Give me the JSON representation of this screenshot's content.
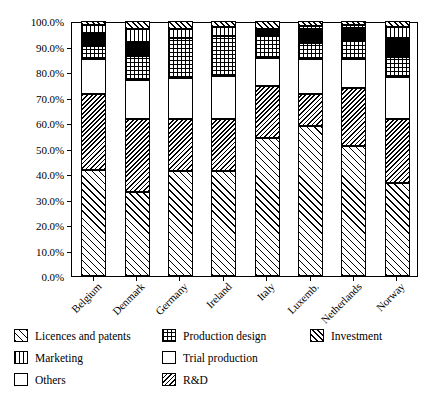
{
  "chart_data": {
    "type": "bar",
    "subtype": "stacked-100-percent",
    "title": "",
    "xlabel": "",
    "ylabel": "",
    "ylim": [
      0,
      100
    ],
    "ytick_labels": [
      "0.0%",
      "10.0%",
      "20.0%",
      "30.0%",
      "40.0%",
      "50.0%",
      "60.0%",
      "70.0%",
      "80.0%",
      "90.0%",
      "100.0%"
    ],
    "ytick_values": [
      0,
      10,
      20,
      30,
      40,
      50,
      60,
      70,
      80,
      90,
      100
    ],
    "grid": false,
    "legend_position": "bottom",
    "categories": [
      "Belgium",
      "Denmark",
      "Germany",
      "Ireland",
      "Italy",
      "Luxemb.",
      "Netherlands",
      "Norway"
    ],
    "series": [
      {
        "name": "Licences and patents",
        "pattern": "sparse-diagonal-forward",
        "values": [
          41.5,
          33.0,
          41.0,
          41.0,
          54.0,
          58.8,
          51.0,
          36.5
        ]
      },
      {
        "name": "R&D",
        "pattern": "dense-diagonal-back",
        "values": [
          30.0,
          28.5,
          20.5,
          20.5,
          20.5,
          12.5,
          22.8,
          25.0
        ]
      },
      {
        "name": "Trial production",
        "pattern": "white",
        "values": [
          13.5,
          15.5,
          16.0,
          17.0,
          11.0,
          14.0,
          11.5,
          16.5
        ]
      },
      {
        "name": "Production design",
        "pattern": "checker",
        "values": [
          5.3,
          9.3,
          16.0,
          15.5,
          8.5,
          6.0,
          7.0,
          8.0
        ]
      },
      {
        "name": "Others",
        "pattern": "solid-black",
        "values": [
          5.0,
          5.5,
          0.0,
          0.0,
          3.0,
          5.5,
          5.0,
          7.5
        ]
      },
      {
        "name": "Marketing",
        "pattern": "vertical-lines",
        "values": [
          3.0,
          5.2,
          3.5,
          3.5,
          0.0,
          1.2,
          1.2,
          4.0
        ]
      },
      {
        "name": "Investment",
        "pattern": "medium-diagonal-forward",
        "values": [
          1.7,
          3.0,
          3.0,
          2.5,
          3.0,
          2.0,
          1.5,
          2.5
        ]
      }
    ]
  },
  "legend": {
    "items": [
      {
        "label": "Licences and patents",
        "pattern": "licences",
        "col": 0,
        "row": 0
      },
      {
        "label": "Marketing",
        "pattern": "marketing",
        "col": 0,
        "row": 1
      },
      {
        "label": "Others",
        "pattern": "others",
        "col": 0,
        "row": 2
      },
      {
        "label": "Production design",
        "pattern": "production",
        "col": 1,
        "row": 0
      },
      {
        "label": "Trial production",
        "pattern": "trial",
        "col": 1,
        "row": 1
      },
      {
        "label": "R&D",
        "pattern": "rd",
        "col": 1,
        "row": 2
      },
      {
        "label": "Investment",
        "pattern": "investment",
        "col": 2,
        "row": 0
      }
    ]
  },
  "colors": {
    "axis": "#000000",
    "plot_background": "#ffffff",
    "others_fill": "#000000",
    "page_background": "#ffffff"
  }
}
